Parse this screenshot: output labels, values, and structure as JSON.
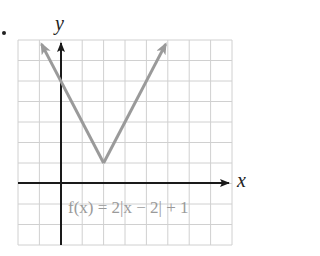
{
  "problem_marker": "•",
  "chart_data": {
    "type": "line",
    "title": "",
    "function_label": "f(x) = 2|x − 2| + 1",
    "xlabel": "x",
    "ylabel": "y",
    "xlim": [
      -2,
      8
    ],
    "ylim": [
      -3,
      7
    ],
    "grid": true,
    "grid_step": 1,
    "tick_labels": false,
    "series": [
      {
        "name": "f(x) = 2|x − 2| + 1",
        "color": "#9a9a9a",
        "x": [
          -0.9,
          2,
          4.9
        ],
        "y": [
          6.8,
          1,
          6.8
        ],
        "vertex": [
          2,
          1
        ],
        "arrows_at_ends": true
      }
    ]
  },
  "colors": {
    "grid": "#d0d0d0",
    "axis": "#1a1a1a",
    "curve": "#9a9a9a"
  }
}
